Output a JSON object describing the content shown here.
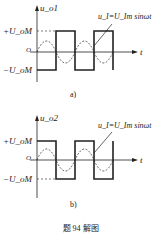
{
  "panel_a": {
    "y_label": "u_o1",
    "plus_label": "+U_oM",
    "minus_label": "−U_oM",
    "origin": "O",
    "t_label": "t",
    "annotation": "u_I=U_Im sinωt",
    "caption": "a)"
  },
  "panel_b": {
    "y_label": "u_o2",
    "plus_label": "+U_oM",
    "minus_label": "−U_oM",
    "origin": "O",
    "t_label": "t",
    "annotation": "u_I=U_Im sinωt",
    "caption": "b)"
  },
  "figure_caption": "题 94 解图"
}
